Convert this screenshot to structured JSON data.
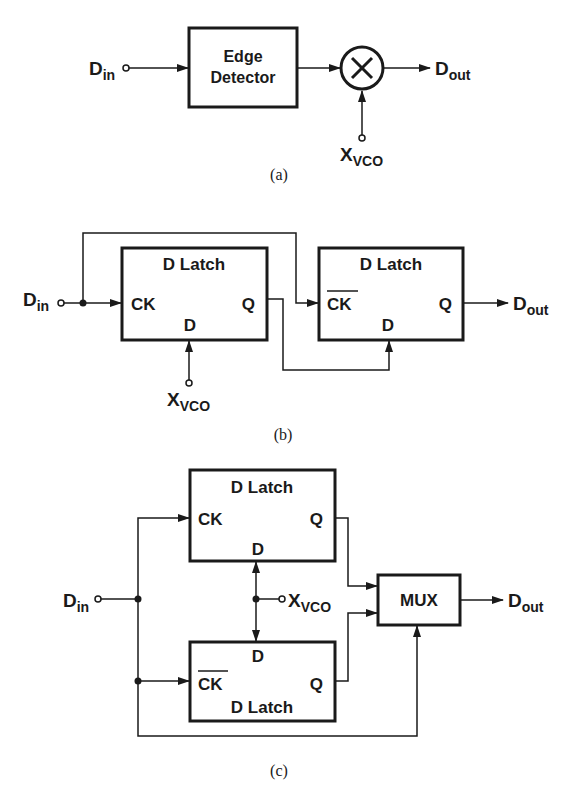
{
  "diagram_a": {
    "caption": "(a)",
    "input": {
      "main": "D",
      "sub": "in"
    },
    "block": {
      "line1": "Edge",
      "line2": "Detector"
    },
    "mixer_symbol": "×",
    "vco": {
      "main": "X",
      "sub": "VCO"
    },
    "output": {
      "main": "D",
      "sub": "out"
    }
  },
  "diagram_b": {
    "caption": "(b)",
    "input": {
      "main": "D",
      "sub": "in"
    },
    "latch1": {
      "title": "D Latch",
      "clk": "CK",
      "d": "D",
      "q": "Q"
    },
    "latch2": {
      "title": "D Latch",
      "clk": "CK",
      "d": "D",
      "q": "Q"
    },
    "vco": {
      "main": "X",
      "sub": "VCO"
    },
    "output": {
      "main": "D",
      "sub": "out"
    }
  },
  "diagram_c": {
    "caption": "(c)",
    "input": {
      "main": "D",
      "sub": "in"
    },
    "latch_top": {
      "title": "D Latch",
      "clk": "CK",
      "d": "D",
      "q": "Q"
    },
    "latch_bottom": {
      "title": "D Latch",
      "clk": "CK",
      "d": "D",
      "q": "Q"
    },
    "mux": "MUX",
    "vco": {
      "main": "X",
      "sub": "VCO"
    },
    "output": {
      "main": "D",
      "sub": "out"
    }
  }
}
